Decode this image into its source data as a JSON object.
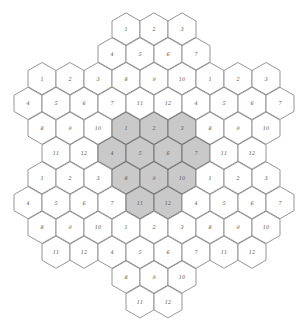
{
  "diagram": {
    "type": "hex-grid",
    "orientation": "pointy-top",
    "colors": {
      "cell_fill": "#ffffff",
      "shaded_fill": "#c9c9c9",
      "stroke": "#8a8a8a",
      "shaded_stroke": "#6e6e6e",
      "label": "#555555"
    },
    "geometry": {
      "col_spacing": 28,
      "row_spacing": 24.8,
      "first_row_y": 29,
      "radius": 16.1
    },
    "rows": [
      {
        "y_index": 0,
        "x": [
          126,
          154,
          182
        ],
        "labels": [
          "1",
          "2",
          "3"
        ],
        "shaded": []
      },
      {
        "y_index": 1,
        "x": [
          112,
          140,
          168,
          196
        ],
        "labels": [
          "4",
          "5",
          "6",
          "7"
        ],
        "shaded": []
      },
      {
        "y_index": 2,
        "x": [
          42,
          70,
          98,
          126,
          154,
          182,
          210,
          238,
          266
        ],
        "labels": [
          "1",
          "2",
          "3",
          "8",
          "9",
          "10",
          "1",
          "2",
          "3"
        ],
        "shaded": []
      },
      {
        "y_index": 3,
        "x": [
          28,
          56,
          84,
          112,
          140,
          168,
          196,
          224,
          252,
          280
        ],
        "labels": [
          "4",
          "5",
          "6",
          "7",
          "11",
          "12",
          "4",
          "5",
          "6",
          "7"
        ],
        "shaded": []
      },
      {
        "y_index": 4,
        "x": [
          42,
          70,
          98,
          126,
          154,
          182,
          210,
          238,
          266
        ],
        "labels": [
          "8",
          "9",
          "10",
          "1",
          "2",
          "3",
          "8",
          "9",
          "10"
        ],
        "shaded": [
          3,
          4,
          5
        ]
      },
      {
        "y_index": 5,
        "x": [
          56,
          84,
          112,
          140,
          168,
          196,
          224,
          252
        ],
        "labels": [
          "11",
          "12",
          "4",
          "5",
          "6",
          "7",
          "11",
          "12"
        ],
        "shaded": [
          2,
          3,
          4,
          5
        ]
      },
      {
        "y_index": 6,
        "x": [
          42,
          70,
          98,
          126,
          154,
          182,
          210,
          238,
          266
        ],
        "labels": [
          "1",
          "2",
          "3",
          "8",
          "9",
          "10",
          "1",
          "2",
          "3"
        ],
        "shaded": [
          3,
          4,
          5
        ]
      },
      {
        "y_index": 7,
        "x": [
          28,
          56,
          84,
          112,
          140,
          168,
          196,
          224,
          252,
          280
        ],
        "labels": [
          "4",
          "5",
          "6",
          "7",
          "11",
          "12",
          "4",
          "5",
          "6",
          "7"
        ],
        "shaded": [
          4,
          5
        ]
      },
      {
        "y_index": 8,
        "x": [
          42,
          70,
          98,
          126,
          154,
          182,
          210,
          238,
          266
        ],
        "labels": [
          "8",
          "9",
          "10",
          "1",
          "2",
          "3",
          "8",
          "9",
          "10"
        ],
        "shaded": []
      },
      {
        "y_index": 9,
        "x": [
          56,
          84,
          112,
          140,
          168,
          196,
          224,
          252
        ],
        "labels": [
          "11",
          "12",
          "4",
          "5",
          "6",
          "7",
          "11",
          "12"
        ],
        "shaded": []
      },
      {
        "y_index": 10,
        "x": [
          126,
          154,
          182
        ],
        "labels": [
          "8",
          "9",
          "10"
        ],
        "shaded": []
      },
      {
        "y_index": 11,
        "x": [
          140,
          168
        ],
        "labels": [
          "11",
          "12"
        ],
        "shaded": []
      }
    ]
  }
}
